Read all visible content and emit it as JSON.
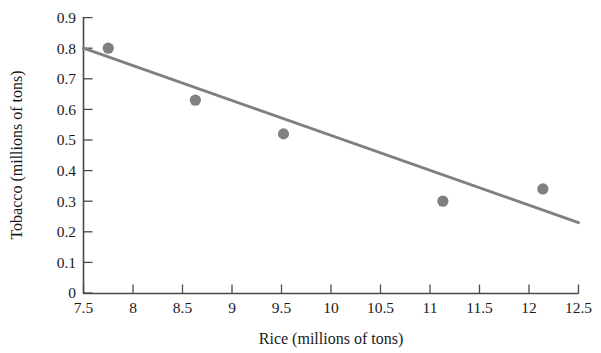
{
  "chart_data": {
    "type": "scatter",
    "title": "",
    "xlabel": "Rice (millions of tons)",
    "ylabel": "Tobacco (millions of tons)",
    "xlim": [
      7.5,
      12.5
    ],
    "ylim": [
      0,
      0.9
    ],
    "grid": false,
    "legend": null,
    "x_ticks": [
      7.5,
      8,
      8.5,
      9,
      9.5,
      10,
      10.5,
      11,
      11.5,
      12,
      12.5
    ],
    "x_tick_labels": [
      "7.5",
      "8",
      "8.5",
      "9",
      "9.5",
      "10",
      "10.5",
      "11",
      "11.5",
      "12",
      "12.5"
    ],
    "y_ticks": [
      0,
      0.1,
      0.2,
      0.3,
      0.4,
      0.5,
      0.6,
      0.7,
      0.8,
      0.9
    ],
    "y_tick_labels": [
      "0",
      "0.1",
      "0.2",
      "0.3",
      "0.4",
      "0.5",
      "0.6",
      "0.7",
      "0.8",
      "0.9"
    ],
    "points": [
      {
        "x": 7.75,
        "y": 0.8
      },
      {
        "x": 8.63,
        "y": 0.63
      },
      {
        "x": 9.52,
        "y": 0.52
      },
      {
        "x": 11.13,
        "y": 0.3
      },
      {
        "x": 12.14,
        "y": 0.34
      }
    ],
    "series": [
      {
        "name": "Tobacco vs Rice",
        "type": "scatter",
        "marker_color": "#808080",
        "x": [
          7.75,
          8.63,
          9.52,
          11.13,
          12.14
        ],
        "values": [
          0.8,
          0.63,
          0.52,
          0.3,
          0.34
        ]
      },
      {
        "name": "Least-squares regression line",
        "type": "line",
        "line_color": "#808080",
        "x": [
          7.5,
          12.5
        ],
        "values": [
          0.8,
          0.23
        ]
      }
    ],
    "colors": {
      "marker": "#808080",
      "line": "#808080",
      "axis": "#4a4a4a",
      "text": "#1a1a1a",
      "background": "#ffffff"
    }
  },
  "axes": {
    "x_title": "Rice (millions of tons)",
    "y_title": "Tobacco (millions of tons)"
  }
}
